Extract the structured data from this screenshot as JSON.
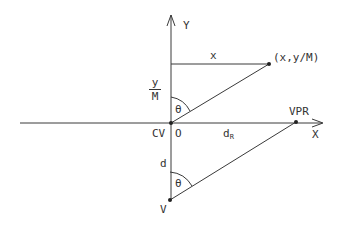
{
  "diagram": {
    "type": "geometric-projection",
    "colors": {
      "line": "#3a3a3a",
      "text": "#333333",
      "background": "#ffffff"
    },
    "axes": {
      "x_label": "X",
      "y_label": "Y"
    },
    "points": {
      "origin_cv": "CV",
      "origin_o": "O",
      "projected_point": "(x,y/M)",
      "vpr": "VPR",
      "viewpoint": "V"
    },
    "labels": {
      "x_distance": "x",
      "y_over_m_num": "y",
      "y_over_m_den": "M",
      "theta_top": "θ",
      "theta_bottom": "θ",
      "d": "d",
      "d_r_main": "d",
      "d_r_sub": "R"
    }
  }
}
